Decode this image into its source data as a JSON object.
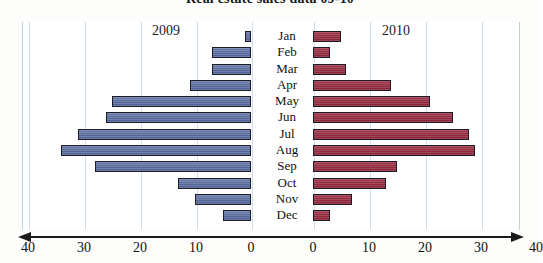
{
  "chart_data": {
    "type": "bar",
    "orientation": "horizontal-bidirectional",
    "title": "Real estate sales data 09-10",
    "xlabel": "",
    "ylabel": "",
    "categories": [
      "Jan",
      "Feb",
      "Mar",
      "Apr",
      "May",
      "Jun",
      "Jul",
      "Aug",
      "Sep",
      "Oct",
      "Nov",
      "Dec"
    ],
    "series": [
      {
        "name": "2009",
        "side": "left",
        "color": "#56679c",
        "values": [
          1,
          7,
          7,
          11,
          25,
          26,
          31,
          34,
          28,
          13,
          10,
          5
        ]
      },
      {
        "name": "2010",
        "side": "right",
        "color": "#93293f",
        "values": [
          5,
          3,
          6,
          14,
          21,
          25,
          28,
          29,
          15,
          13,
          7,
          3
        ]
      }
    ],
    "xlim_left": [
      40,
      0
    ],
    "xlim_right": [
      0,
      40
    ],
    "xticks_left": [
      "40",
      "30",
      "20",
      "10",
      "0"
    ],
    "xticks_right": [
      "0",
      "10",
      "20",
      "30",
      "40"
    ],
    "grid": true,
    "legend_position": "inside-top",
    "legend": [
      "2009",
      "2010"
    ]
  },
  "axis": {
    "left_ticks": [
      {
        "label": "40",
        "x": 28
      },
      {
        "label": "30",
        "x": 84
      },
      {
        "label": "20",
        "x": 140
      },
      {
        "label": "10",
        "x": 196
      },
      {
        "label": "0",
        "x": 251
      }
    ],
    "right_ticks": [
      {
        "label": "0",
        "x": 313
      },
      {
        "label": "10",
        "x": 369
      },
      {
        "label": "20",
        "x": 425
      },
      {
        "label": "30",
        "x": 481
      },
      {
        "label": "40",
        "x": 536
      }
    ]
  },
  "gridlines_left_x": [
    6,
    62,
    118,
    174
  ],
  "gridlines_right_x": [
    347,
    403,
    459
  ],
  "era_labels": {
    "left": "2009",
    "right": "2010"
  }
}
